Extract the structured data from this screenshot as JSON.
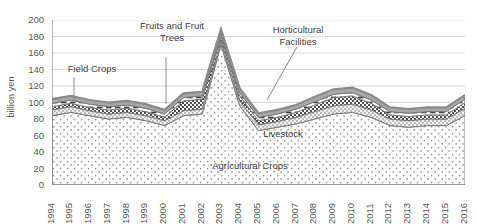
{
  "chart_data": {
    "type": "area",
    "stacked": true,
    "title": "",
    "xlabel": "",
    "ylabel": "billion yen",
    "ylim": [
      0,
      200
    ],
    "ytick_step": 20,
    "grid": true,
    "grid_axis": "y",
    "legend_position": "none",
    "annotations_inline": true,
    "categories": [
      "1994",
      "1995",
      "1996",
      "1997",
      "1998",
      "1999",
      "2000",
      "2001",
      "2002",
      "2003",
      "2004",
      "2005",
      "2006",
      "2007",
      "2008",
      "2009",
      "2010",
      "2011",
      "2012",
      "2013",
      "2014",
      "2015",
      "2016"
    ],
    "yticks": [
      0,
      20,
      40,
      60,
      80,
      100,
      120,
      140,
      160,
      180,
      200
    ],
    "series": [
      {
        "name": "Agricultural Crops",
        "pattern": "sparse-dots",
        "values": [
          84,
          88,
          84,
          80,
          82,
          78,
          72,
          84,
          86,
          170,
          96,
          66,
          70,
          74,
          80,
          86,
          88,
          82,
          72,
          70,
          72,
          72,
          84
        ]
      },
      {
        "name": "Livestock",
        "pattern": "dense-dots",
        "values": [
          7,
          7,
          6,
          6,
          6,
          6,
          6,
          6,
          6,
          5,
          6,
          7,
          7,
          8,
          9,
          10,
          10,
          9,
          8,
          8,
          8,
          8,
          9
        ]
      },
      {
        "name": "Field Crops",
        "pattern": "dark-checker",
        "values": [
          4,
          4,
          4,
          5,
          5,
          5,
          4,
          12,
          12,
          5,
          6,
          5,
          5,
          6,
          8,
          10,
          10,
          8,
          5,
          5,
          5,
          5,
          7
        ]
      },
      {
        "name": "Fruits and Fruit Trees",
        "pattern": "white-dashed",
        "values": [
          4,
          4,
          4,
          4,
          4,
          4,
          4,
          4,
          4,
          4,
          4,
          4,
          4,
          4,
          4,
          4,
          4,
          4,
          4,
          4,
          4,
          4,
          4
        ]
      },
      {
        "name": "Horticultural Facilities",
        "pattern": "gray-band",
        "values": [
          5,
          5,
          5,
          5,
          5,
          5,
          5,
          5,
          5,
          5,
          5,
          5,
          5,
          5,
          6,
          6,
          6,
          6,
          5,
          5,
          5,
          5,
          5
        ]
      }
    ],
    "totals": [
      104,
      108,
      103,
      100,
      102,
      98,
      91,
      111,
      113,
      189,
      117,
      87,
      91,
      97,
      107,
      116,
      118,
      109,
      94,
      92,
      94,
      94,
      109
    ],
    "peak": {
      "year": "2003",
      "value": 189
    },
    "colors": {
      "axis": "#808080",
      "grid": "#d9d9d9",
      "text": "#5a5a5a",
      "top_line": "#8c8c8c",
      "dark_layer": "#595959",
      "light_layer": "#bfbfbf"
    }
  },
  "annotations": {
    "field_crops": "Field Crops",
    "fruits": "Fruits and Fruit\nTrees",
    "horticultural": "Horticultural\nFacilities",
    "livestock": "Livestock",
    "agricultural_crops": "Agricultural Crops"
  }
}
